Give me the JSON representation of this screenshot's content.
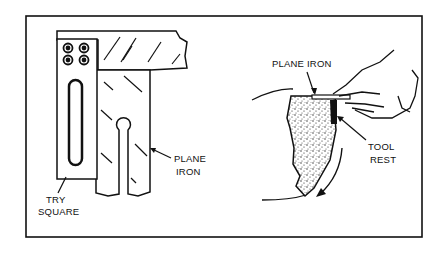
{
  "figure": {
    "left_panel": {
      "labels": {
        "plane_iron_line1": "PLANE",
        "plane_iron_line2": "IRON",
        "try_square_line1": "TRY",
        "try_square_line2": "SQUARE"
      }
    },
    "right_panel": {
      "labels": {
        "plane_iron": "PLANE IRON",
        "tool_rest_line1": "TOOL",
        "tool_rest_line2": "REST"
      }
    },
    "colors": {
      "ink": "#111111",
      "paper": "#ffffff"
    }
  }
}
